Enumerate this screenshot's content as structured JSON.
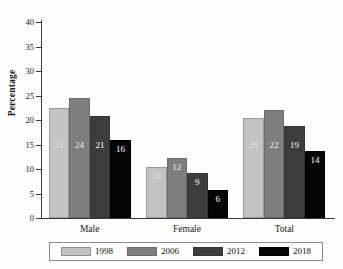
{
  "chart_data": {
    "type": "bar",
    "title": "",
    "subtitle": "",
    "xlabel": "",
    "ylabel": "Percentage",
    "categories": [
      "Male",
      "Female",
      "Total"
    ],
    "series": [
      {
        "name": "1998",
        "color": "#c3c3c3",
        "values": [
          22.4,
          10.4,
          20.4
        ],
        "labels": [
          "22",
          "10",
          "20"
        ]
      },
      {
        "name": "2006",
        "color": "#7e7e7e",
        "values": [
          24.4,
          12.3,
          22.1
        ],
        "labels": [
          "24",
          "12",
          "22"
        ]
      },
      {
        "name": "2012",
        "color": "#3d3d3d",
        "values": [
          20.9,
          9.1,
          18.7
        ],
        "labels": [
          "21",
          "9",
          "19"
        ]
      },
      {
        "name": "2018",
        "color": "#050505",
        "values": [
          15.9,
          5.8,
          13.7
        ],
        "labels": [
          "16",
          "6",
          "14"
        ]
      }
    ],
    "ylim": [
      0,
      40
    ],
    "ytick_labels": [
      "0",
      "5",
      "10",
      "15",
      "20",
      "25",
      "30",
      "35",
      "40"
    ],
    "ytick_values": [
      0,
      5,
      10,
      15,
      20,
      25,
      30,
      35,
      40
    ],
    "grid": false,
    "legend_position": "bottom"
  },
  "legend": {
    "entries": [
      {
        "label": "1998"
      },
      {
        "label": "2006"
      },
      {
        "label": "2012"
      },
      {
        "label": "2018"
      }
    ]
  }
}
